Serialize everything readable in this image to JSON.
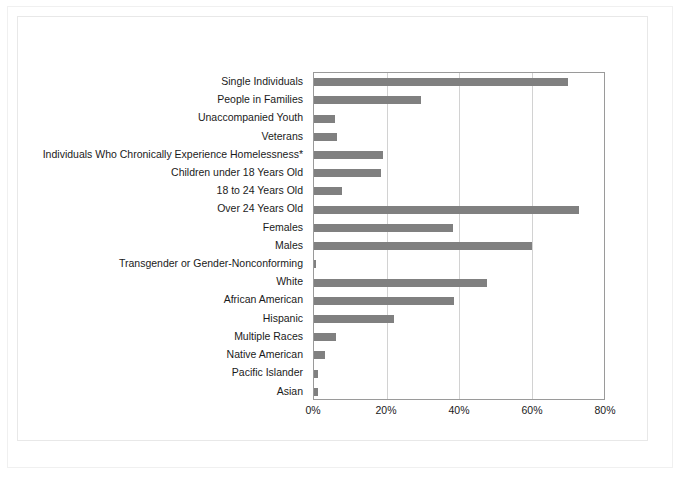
{
  "chart_data": {
    "type": "bar",
    "orientation": "horizontal",
    "title": "",
    "subtitle": "",
    "xlabel": "",
    "ylabel": "",
    "xlim": [
      0,
      80
    ],
    "xticks": [
      0,
      20,
      40,
      60,
      80
    ],
    "xtick_labels": [
      "0%",
      "20%",
      "40%",
      "60%",
      "80%"
    ],
    "grid": "vertical",
    "legend": "none",
    "bar_color": "#808080",
    "plot_border_color": "#9a9a9a",
    "gridline_color": "#d2d2d2",
    "categories": [
      "Single Individuals",
      "People in Families",
      "Unaccompanied Youth",
      "Veterans",
      "Individuals Who Chronically Experience Homelessness*",
      "Children under 18 Years Old",
      "18 to 24 Years Old",
      "Over 24 Years Old",
      "Females",
      "Males",
      "Transgender or Gender-Nonconforming",
      "White",
      "African American",
      "Hispanic",
      "Multiple Races",
      "Native American",
      "Pacific Islander",
      "Asian"
    ],
    "values": [
      70.0,
      29.6,
      5.8,
      6.3,
      19.1,
      18.4,
      7.7,
      73.2,
      38.3,
      60.2,
      0.5,
      47.8,
      38.6,
      22.2,
      6.0,
      3.0,
      1.2,
      1.0
    ],
    "value_unit": "%"
  }
}
